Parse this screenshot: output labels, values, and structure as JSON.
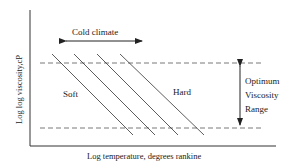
{
  "diagram": {
    "y_axis_label": "Log log viscosity,cP",
    "x_axis_label": "Log temperature, degrees rankine",
    "cold_climate_label": "Cold climate",
    "soft_label": "Soft",
    "hard_label": "Hard",
    "range_label_lines": [
      "Optimum",
      "Viscosity",
      "Range"
    ],
    "line_count": 4,
    "colors": {
      "line": "#333333",
      "dash": "#555555",
      "background": "#ffffff"
    }
  }
}
